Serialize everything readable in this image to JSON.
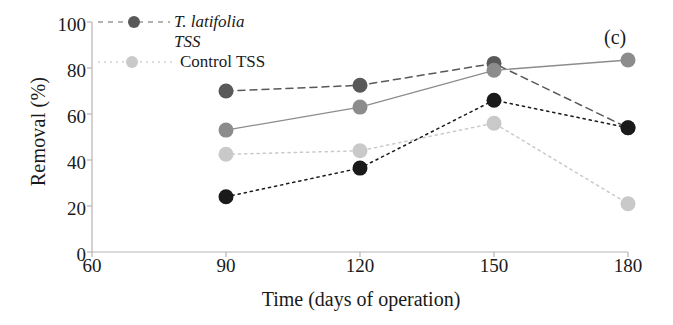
{
  "panel_label": "(c)",
  "axes": {
    "ylabel": "Removal (%)",
    "xlabel": "Time (days of operation)",
    "yticks": [
      "0",
      "20",
      "40",
      "60",
      "80",
      "100"
    ],
    "xticks": [
      "60",
      "90",
      "120",
      "150",
      "180"
    ]
  },
  "legend": {
    "entries": [
      {
        "label": "T. latifolia",
        "italic": true,
        "marker": true,
        "color": "#595959"
      },
      {
        "label": "TSS",
        "italic": true,
        "marker": false,
        "color": "#595959"
      },
      {
        "label": "Control TSS",
        "italic": false,
        "marker": true,
        "color": "#c9c9c9"
      }
    ]
  },
  "colors": {
    "series_dark_gray": "#595959",
    "series_medium_gray": "#8c8c8c",
    "series_light_gray": "#c9c9c9",
    "series_black": "#1a1a1a",
    "axis": "#b5b5b5",
    "text": "#1a1a1a"
  },
  "chart_data": {
    "type": "line",
    "title": "",
    "panel": "(c)",
    "xlabel": "Time (days of operation)",
    "ylabel": "Removal (%)",
    "xlim": [
      60,
      180
    ],
    "ylim": [
      0,
      100
    ],
    "xticks": [
      60,
      90,
      120,
      150,
      180
    ],
    "yticks": [
      0,
      20,
      40,
      60,
      80,
      100
    ],
    "grid": false,
    "legend_position": "top-left",
    "x": [
      90,
      120,
      150,
      180
    ],
    "series": [
      {
        "name": "T. latifolia",
        "color": "#595959",
        "linestyle": "dashed",
        "values": [
          70,
          72.5,
          82,
          54
        ]
      },
      {
        "name": "TSS",
        "color": "#8c8c8c",
        "linestyle": "solid",
        "values": [
          53,
          63,
          79,
          83.5
        ]
      },
      {
        "name": "Control TSS",
        "color": "#c9c9c9",
        "linestyle": "dotted",
        "values": [
          42.5,
          44,
          56,
          21
        ]
      },
      {
        "name": "Control",
        "color": "#1a1a1a",
        "linestyle": "dotted",
        "values": [
          24,
          36.5,
          66,
          54
        ]
      }
    ]
  }
}
